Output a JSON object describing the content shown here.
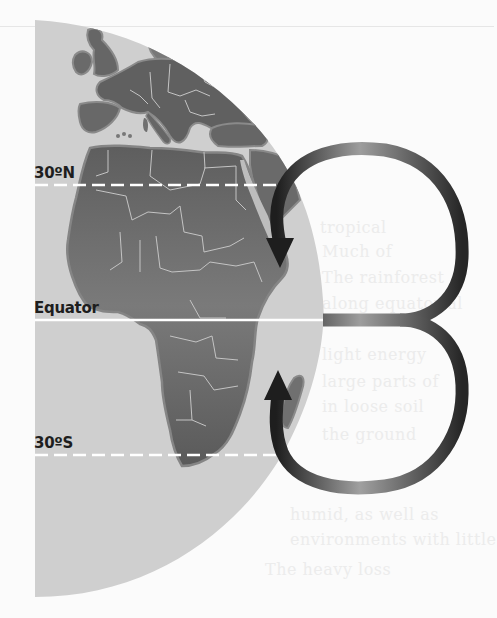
{
  "diagram": {
    "labels": {
      "north": "30ºN",
      "equator": "Equator",
      "south": "30ºS"
    },
    "latitudes": [
      {
        "name": "30N",
        "y": 185,
        "style": "dashed"
      },
      {
        "name": "equator",
        "y": 320,
        "style": "solid"
      },
      {
        "name": "30S",
        "y": 455,
        "style": "dashed"
      }
    ],
    "arrows": [
      {
        "name": "northern-cell",
        "direction": "clockwise-down",
        "head": [
          280,
          262
        ]
      },
      {
        "name": "southern-cell",
        "direction": "counterclockwise-up",
        "head": [
          278,
          376
        ]
      }
    ],
    "colors": {
      "ocean": "#cfcfcf",
      "land": "#6d6d6d",
      "land_dark": "#5c5c5c",
      "coast": "#8a8a8a",
      "border": "#bdbdbd",
      "arrow_dark": "#262626",
      "arrow_light": "#9a9a9a",
      "latitude_line": "#ffffff",
      "label": "#1e1e1e"
    }
  },
  "background": {
    "bleed_through_text": [
      "tropical",
      "Much of",
      "The rainforest",
      "along equatorial",
      "light energy",
      "large parts of",
      "in loose soil",
      "the ground",
      "humid, as well as",
      "environments with little",
      "The heavy loss"
    ]
  }
}
